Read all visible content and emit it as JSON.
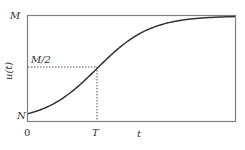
{
  "chart_data": {
    "type": "line",
    "title": "",
    "xlabel": "t",
    "ylabel": "u(t)",
    "x_ticks": [
      "0",
      "T"
    ],
    "y_ticks": [
      "N",
      "M/2",
      "M"
    ],
    "grid": false,
    "legend": null,
    "series": [
      {
        "name": "logistic growth u(t)",
        "description": "S-shaped logistic curve starting at N when t=0, passing through M/2 at t=T, asymptotically approaching M",
        "x": [
          0,
          0.25,
          0.5,
          0.75,
          1.0,
          1.25,
          1.5,
          1.75,
          2.0,
          2.5,
          3.0
        ],
        "y_fraction_of_M": [
          0.07,
          0.13,
          0.23,
          0.36,
          0.5,
          0.64,
          0.77,
          0.87,
          0.93,
          0.98,
          0.995
        ]
      }
    ],
    "annotations": [
      {
        "type": "dotted-hline",
        "y": "M/2",
        "from_x": 0,
        "to_x": "T"
      },
      {
        "type": "dotted-vline",
        "x": "T",
        "from_y": "0",
        "to_y": "M/2"
      }
    ],
    "colors": {
      "axes": "#808080",
      "curve": "#333333",
      "guides": "#555555"
    }
  },
  "labels": {
    "y_top": "M",
    "y_mid": "M/2",
    "y_bottom": "N",
    "y_axis": "u(t)",
    "x_origin": "0",
    "x_mid": "T",
    "x_axis": "t"
  }
}
